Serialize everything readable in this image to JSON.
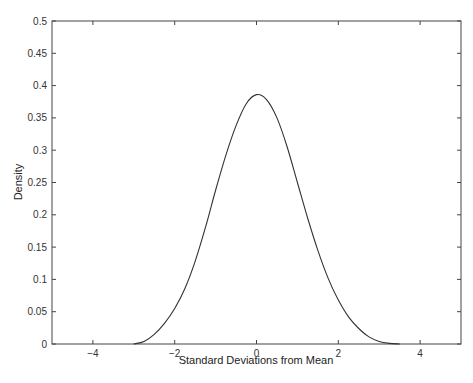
{
  "chart_data": {
    "type": "line",
    "title": "",
    "xlabel": "Standard Deviations from Mean",
    "ylabel": "Density",
    "xlim": [
      -5,
      5
    ],
    "ylim": [
      0,
      0.5
    ],
    "grid": false,
    "legend": null,
    "x_ticks": [
      -4,
      -2,
      0,
      2,
      4
    ],
    "x_tick_labels": [
      "−4",
      "−2",
      "0",
      "2",
      "4"
    ],
    "y_ticks": [
      0,
      0.05,
      0.1,
      0.15,
      0.2,
      0.25,
      0.3,
      0.35,
      0.4,
      0.45,
      0.5
    ],
    "y_tick_labels": [
      "0",
      "0.05",
      "0.1",
      "0.15",
      "0.2",
      "0.25",
      "0.3",
      "0.35",
      "0.4",
      "0.45",
      "0.5"
    ],
    "series": [
      {
        "name": "density",
        "color": "#333333",
        "x": [
          -3.0,
          -2.75,
          -2.5,
          -2.25,
          -2.0,
          -1.75,
          -1.5,
          -1.25,
          -1.0,
          -0.75,
          -0.5,
          -0.25,
          0.0,
          0.25,
          0.5,
          0.75,
          1.0,
          1.25,
          1.5,
          1.75,
          2.0,
          2.25,
          2.5,
          2.75,
          3.0,
          3.25,
          3.5
        ],
        "y": [
          0.0,
          0.004,
          0.015,
          0.032,
          0.055,
          0.086,
          0.128,
          0.18,
          0.238,
          0.292,
          0.338,
          0.372,
          0.386,
          0.378,
          0.35,
          0.305,
          0.25,
          0.195,
          0.145,
          0.102,
          0.068,
          0.042,
          0.024,
          0.011,
          0.004,
          0.001,
          0.0
        ]
      }
    ]
  }
}
